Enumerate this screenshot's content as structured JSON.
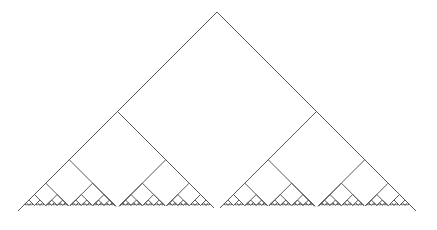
{
  "diagram": {
    "type": "recursive-binary-tree",
    "canvas": {
      "width": 437,
      "height": 230,
      "background": "#ffffff"
    },
    "stroke": {
      "color": "#5a5a5a",
      "width": 1
    },
    "root": {
      "apex_x": 217,
      "apex_y": 12,
      "half_width": 199
    },
    "child_scale": 0.485,
    "depth": 8
  }
}
